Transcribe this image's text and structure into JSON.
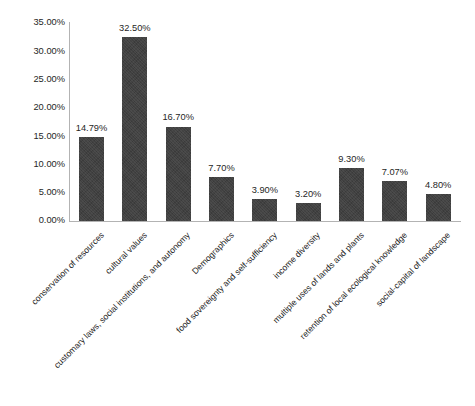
{
  "chart_data": {
    "type": "bar",
    "title": "",
    "subtitle": "",
    "xlabel": "",
    "ylabel": "",
    "ylim": [
      0,
      35
    ],
    "grid": false,
    "legend": null,
    "y_tick_labels": [
      "35.00%",
      "30.00%",
      "25.00%",
      "20.00%",
      "15.00%",
      "10.00%",
      "5.00%",
      "0.00%"
    ],
    "y_tick_values": [
      35,
      30,
      25,
      20,
      15,
      10,
      5,
      0
    ],
    "value_label_suffix": "%",
    "bar_color": "#414141",
    "axis_color": "#b3b3b3",
    "text_color": "#262626",
    "categories": [
      "conservation of resources",
      "cultural values",
      "customary laws, social institutions, and autonomy",
      "Demographics",
      "food sovereignty and self-sufficiency",
      "income diversity",
      "multiple uses of lands and plants",
      "retention of local ecological knowledge",
      "social-capital of landscape"
    ],
    "values": [
      14.79,
      32.5,
      16.7,
      7.7,
      3.9,
      3.2,
      9.3,
      7.07,
      4.8
    ],
    "value_labels": [
      "14.79%",
      "32.50%",
      "16.70%",
      "7.70%",
      "3.90%",
      "3.20%",
      "9.30%",
      "7.07%",
      "4.80%"
    ],
    "bars": [
      {
        "category": "conservation of resources",
        "value": 14.79,
        "label": "14.79%"
      },
      {
        "category": "cultural values",
        "value": 32.5,
        "label": "32.50%"
      },
      {
        "category": "customary laws, social institutions, and autonomy",
        "value": 16.7,
        "label": "16.70%"
      },
      {
        "category": "Demographics",
        "value": 7.7,
        "label": "7.70%"
      },
      {
        "category": "food sovereignty and self-sufficiency",
        "value": 3.9,
        "label": "3.90%"
      },
      {
        "category": "income diversity",
        "value": 3.2,
        "label": "3.20%"
      },
      {
        "category": "multiple uses of lands and plants",
        "value": 9.3,
        "label": "9.30%"
      },
      {
        "category": "retention of local ecological knowledge",
        "value": 7.07,
        "label": "7.07%"
      },
      {
        "category": "social-capital of landscape",
        "value": 4.8,
        "label": "4.80%"
      }
    ]
  }
}
